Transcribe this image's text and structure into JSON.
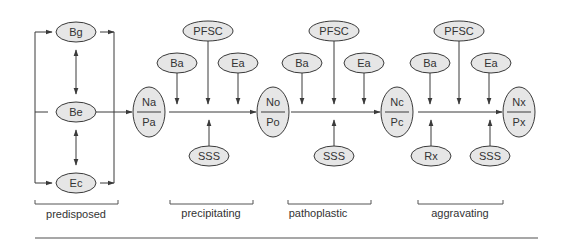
{
  "diagram": {
    "colors": {
      "node_fill": "#e6e6e6",
      "node_stroke": "#3a3a3a",
      "line": "#3a3a3a",
      "text": "#333333",
      "rule": "#8a8a8a"
    },
    "predisposed": {
      "label": "predisposed",
      "nodes": {
        "bg": "Bg",
        "be": "Be",
        "ec": "Ec"
      }
    },
    "states": {
      "s0": {
        "top": "Na",
        "bottom": "Pa"
      },
      "s1": {
        "top": "No",
        "bottom": "Po"
      },
      "s2": {
        "top": "Nc",
        "bottom": "Pc"
      },
      "s3": {
        "top": "Nx",
        "bottom": "Px"
      }
    },
    "phases": [
      {
        "label": "precipitating",
        "top_nodes": {
          "pfsc": "PFSC",
          "ba": "Ba",
          "ea": "Ea"
        },
        "bottom_nodes": [
          "SSS"
        ]
      },
      {
        "label": "pathoplastic",
        "top_nodes": {
          "pfsc": "PFSC",
          "ba": "Ba",
          "ea": "Ea"
        },
        "bottom_nodes": [
          "SSS"
        ]
      },
      {
        "label": "aggravating",
        "top_nodes": {
          "pfsc": "PFSC",
          "ba": "Ba",
          "ea": "Ea"
        },
        "bottom_nodes": [
          "Rx",
          "SSS"
        ]
      }
    ]
  }
}
